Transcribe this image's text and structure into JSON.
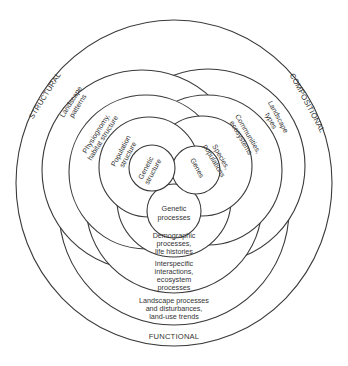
{
  "diagram": {
    "type": "nested-overlapping-circles",
    "attributes": {
      "structural": "STRUCTURAL",
      "compositional": "COMPOSITIONAL",
      "functional": "FUNCTIONAL"
    },
    "structural": {
      "landscape": [
        "Landscape",
        "patterns"
      ],
      "community": [
        "Physiognomy,",
        "habitat structure"
      ],
      "population": [
        "Population",
        "structure"
      ],
      "genetic": [
        "Genetic",
        "structure"
      ]
    },
    "compositional": {
      "landscape": [
        "Landscape",
        "types"
      ],
      "community": [
        "Communities,",
        "ecosystems"
      ],
      "population": [
        "Species,",
        "populations"
      ],
      "genetic": [
        "Genes"
      ]
    },
    "functional": {
      "genetic": [
        "Genetic",
        "processes"
      ],
      "population": [
        "Demographic",
        "processes,",
        "life histories"
      ],
      "community": [
        "Interspecific",
        "interactions,",
        "ecosystem",
        "processes"
      ],
      "landscape": [
        "Landscape processes",
        "and disturbances,",
        "land-use trends"
      ]
    }
  }
}
